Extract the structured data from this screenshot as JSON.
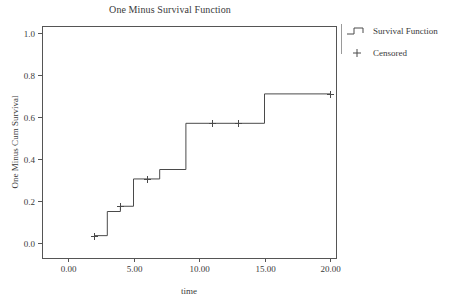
{
  "chart_data": {
    "type": "line",
    "subtype": "step",
    "title": "One Minus Survival Function",
    "xlabel": "time",
    "ylabel": "One Minus Cum Survival",
    "xlim": [
      -1.0,
      21.5
    ],
    "ylim": [
      -0.06,
      1.08
    ],
    "grid": false,
    "legend_position": "right",
    "x_ticks": [
      0,
      5,
      10,
      15,
      20
    ],
    "x_tick_labels": [
      "0.00",
      "5.00",
      "10.00",
      "15.00",
      "20.00"
    ],
    "y_ticks": [
      0.0,
      0.2,
      0.4,
      0.6,
      0.8,
      1.0
    ],
    "y_tick_labels": [
      "0.0",
      "0.2",
      "0.4",
      "0.6",
      "0.8",
      "1.0"
    ],
    "series": [
      {
        "name": "Survival Function",
        "marker": "step-line",
        "x": [
          2,
          3,
          4,
          5,
          7,
          9,
          15,
          20
        ],
        "y": [
          0.035,
          0.15,
          0.175,
          0.305,
          0.35,
          0.57,
          0.71,
          0.71
        ]
      },
      {
        "name": "Censored",
        "marker": "plus",
        "x": [
          2,
          4,
          6,
          11,
          13,
          20
        ],
        "y": [
          0.035,
          0.175,
          0.305,
          0.57,
          0.57,
          0.71
        ]
      }
    ]
  },
  "legend": {
    "items": [
      {
        "label": "Survival Function",
        "glyph": "step-line-glyph"
      },
      {
        "label": "Censored",
        "glyph": "plus-glyph"
      }
    ]
  },
  "colors": {
    "line": "#4a4a4a",
    "frame": "#555555",
    "text": "#3a3a3a",
    "background": "#ffffff"
  }
}
